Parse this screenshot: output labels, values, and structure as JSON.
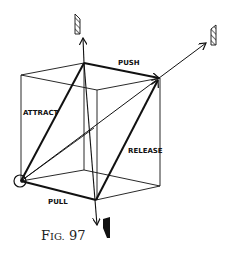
{
  "figure": {
    "caption_prefix": "F",
    "caption_smallcaps": "IG.",
    "caption_number": "97",
    "caption": "Fig. 97"
  },
  "labels": {
    "push": "PUSH",
    "attract": "ATTRACT",
    "release": "RELEASE",
    "pull": "PULL"
  },
  "colors": {
    "line": "#111111",
    "background": "#ffffff"
  }
}
